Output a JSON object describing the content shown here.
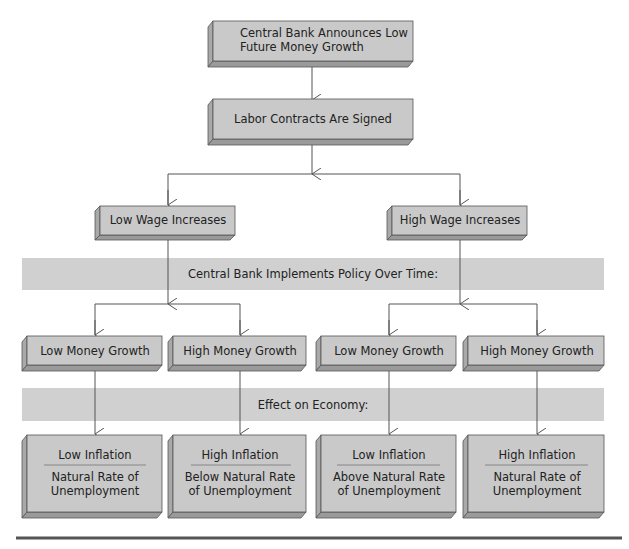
{
  "diagram": {
    "top_box": {
      "lines": [
        "Central Bank Announces Low",
        "Future Money Growth"
      ]
    },
    "second_box": {
      "label": "Labor Contracts Are Signed"
    },
    "wage_boxes": [
      {
        "label": "Low Wage Increases"
      },
      {
        "label": "High Wage Increases"
      }
    ],
    "band_policy": {
      "label": "Central Bank Implements Policy Over Time:"
    },
    "money_boxes": [
      {
        "label": "Low Money Growth"
      },
      {
        "label": "High Money Growth"
      },
      {
        "label": "Low Money Growth"
      },
      {
        "label": "High Money Growth"
      }
    ],
    "band_effect": {
      "label": "Effect on Economy:"
    },
    "outcome_boxes": [
      {
        "inflation": "Low Inflation",
        "unemployment": [
          "Natural Rate of",
          "Unemployment"
        ]
      },
      {
        "inflation": "High Inflation",
        "unemployment": [
          "Below Natural Rate",
          "of Unemployment"
        ]
      },
      {
        "inflation": "Low Inflation",
        "unemployment": [
          "Above Natural Rate",
          "of Unemployment"
        ]
      },
      {
        "inflation": "High Inflation",
        "unemployment": [
          "Natural Rate of",
          "Unemployment"
        ]
      }
    ]
  },
  "colors": {
    "box_face": "#c9c9c9",
    "box_side": "#a9a9a9",
    "band": "#d0d0d0",
    "line": "#555555"
  }
}
